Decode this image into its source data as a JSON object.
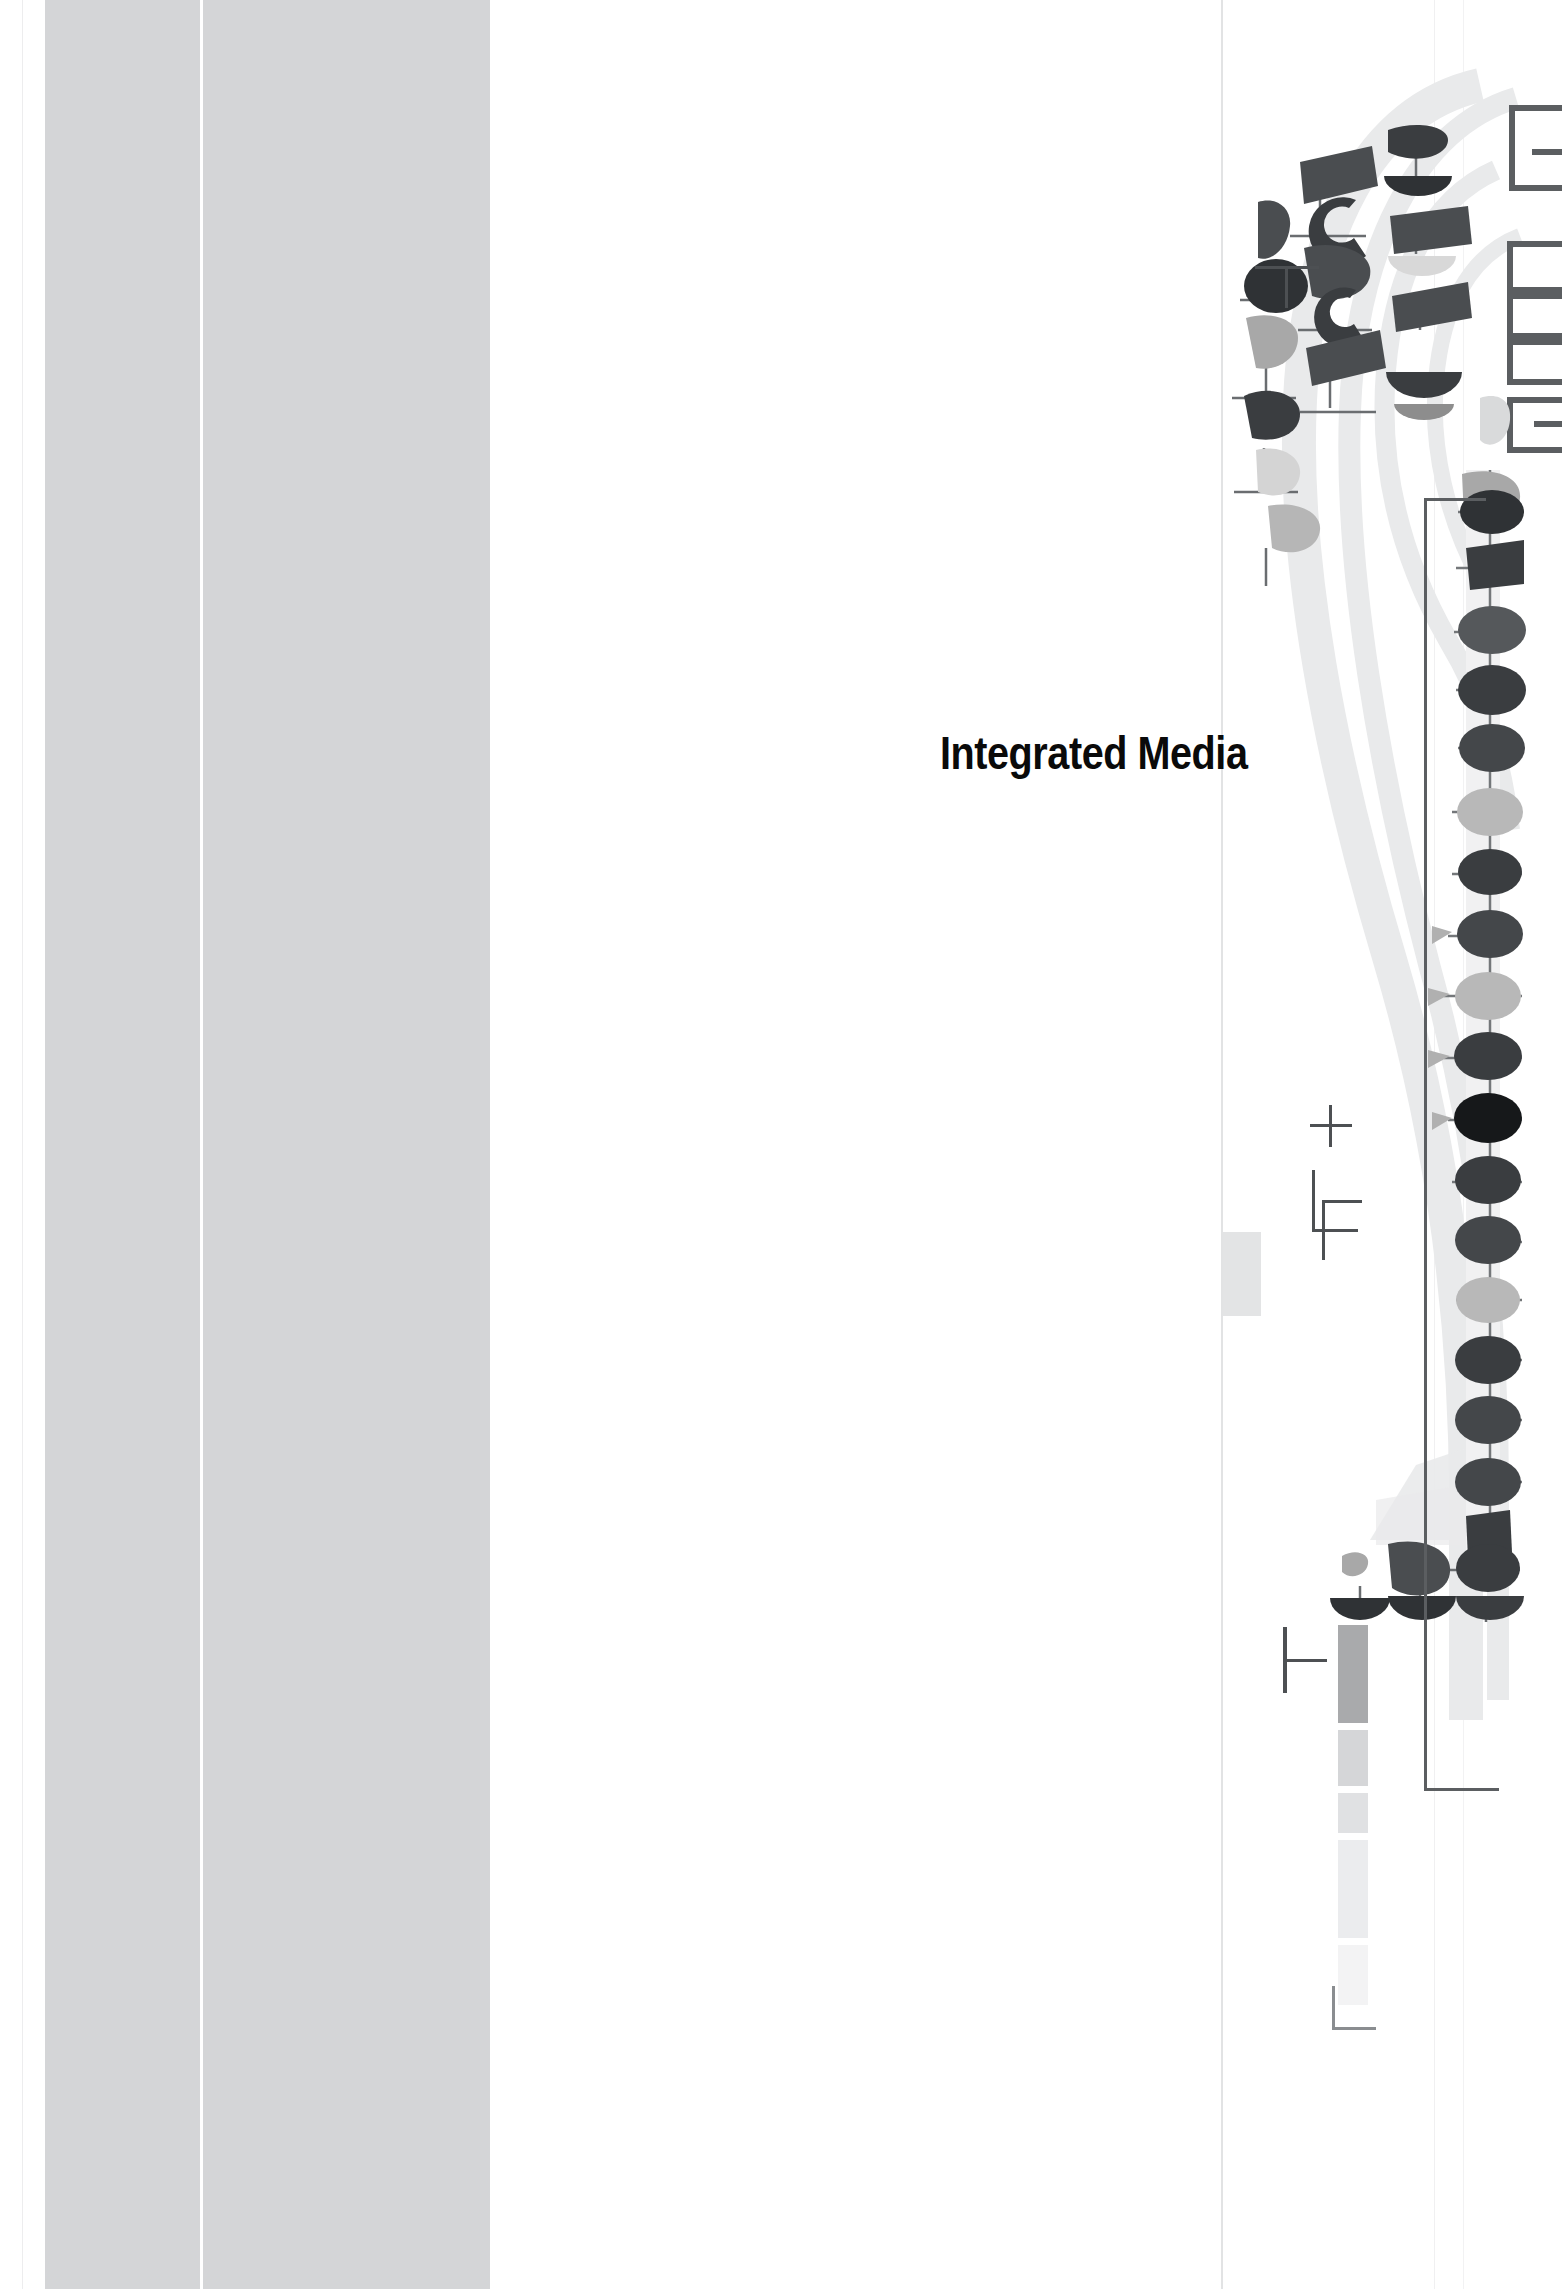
{
  "page": {
    "title": "Integrated Media",
    "background_color": "#ffffff",
    "width": 1562,
    "height": 2289
  },
  "left_band": {
    "name": "left-gray-band",
    "color": "#d4d5d7",
    "divider_color": "#ffffff"
  },
  "rules": {
    "color": "#e8e9ea",
    "patch_color": "#e3e4e5"
  },
  "decoration": {
    "label": "abstract-cover-graphic",
    "dark_color": "#333639",
    "mid_color": "#5b5e61",
    "light_color": "#a8a8a8",
    "pale_color": "#e6e7e8",
    "swoosh_color": "#e9eaeb"
  },
  "bars": {
    "values": [
      "#a9aaac",
      "#d5d6d8",
      "#e0e1e3",
      "#ebecee",
      "#f3f3f4"
    ]
  },
  "marks": {
    "tee": "T",
    "plus": "+",
    "ell": "L",
    "corner": "L",
    "color": "#4d5053"
  }
}
